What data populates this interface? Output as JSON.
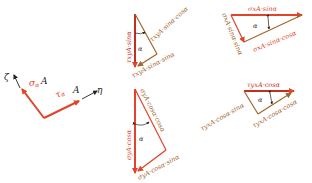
{
  "colors": {
    "red": "#e0452a",
    "brown": "#a0672f",
    "dark_red": "#c0301c",
    "black": "#222222"
  },
  "axes_element": {
    "zeta_label": "ζ",
    "eta_label": "η",
    "sigma_label": "σ",
    "sigma_sub": "α",
    "sigma_A": "A",
    "tau_label": "τ",
    "tau_sub": "α",
    "tau_A": "A"
  },
  "triangle_tau_xy_sin": {
    "vertical_label": "τxyA·sinα",
    "hyp_label": "τxyA·sinα·cosα",
    "base_label": "τxyA·sinα·sinα",
    "angle": "α"
  },
  "triangle_sigma_x": {
    "top_label": "σxA·sinα",
    "left_label": "σxA·sinα·sinα",
    "base_label": "σxA·sinα·cosα",
    "angle": "α"
  },
  "triangle_sigma_y": {
    "vertical_label": "σyA·cosα",
    "hyp_label": "σyA·cosα·cosα",
    "base_label": "σyA·cosα·sinα",
    "angle": "α"
  },
  "triangle_tau_yx": {
    "top_label": "τyxA·cosα",
    "left_label": "τyxA·cosα·sinα",
    "base_label": "τyxA·cosα·cosα",
    "angle": "α"
  }
}
